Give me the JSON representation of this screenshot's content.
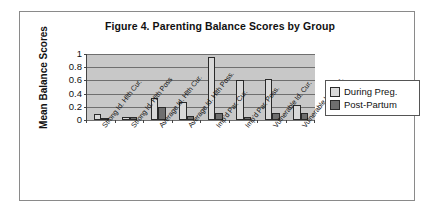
{
  "chart_data": {
    "type": "bar",
    "title": "Figure 4.  Parenting Balance Scores by Group",
    "xlabel": "",
    "ylabel": "Mean Balance Scores",
    "ylim": [
      0,
      1
    ],
    "yticks": [
      "0",
      "0.2",
      "0.4",
      "0.6",
      "0.8",
      "1"
    ],
    "grid": true,
    "legend_position": "right",
    "categories": [
      "Strong Id. Hlth Cur.",
      "Strong Id. Hlth Poss",
      "Average Id. Hlth Cur.",
      "Average Id. Hlth Poss.",
      "Imp'd Par. Cur.",
      "Imp'd Par. Poss.",
      "Vulnerable Id. Cur.",
      "Vulnerable Id. Poss."
    ],
    "series": [
      {
        "name": "During Preg.",
        "color": "#d9d9d9",
        "values": [
          0.09,
          0.04,
          0.33,
          0.27,
          0.96,
          0.6,
          0.62,
          0.22
        ]
      },
      {
        "name": "Post-Partum",
        "color": "#6e6e6e",
        "values": [
          0.02,
          0.05,
          0.19,
          0.06,
          0.1,
          0.05,
          0.11,
          0.1
        ]
      }
    ]
  },
  "legend": {
    "items": [
      {
        "label": "During Preg."
      },
      {
        "label": "Post-Partum"
      }
    ]
  }
}
